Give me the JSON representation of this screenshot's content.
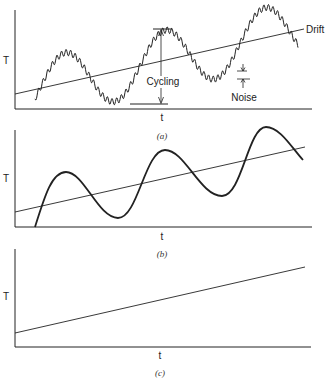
{
  "figure": {
    "panels": [
      {
        "id": "a",
        "caption": "(a)",
        "y_label": "T",
        "x_label": "t",
        "annotations": {
          "drift": "Drift",
          "cycling": "Cycling",
          "noise": "Noise"
        }
      },
      {
        "id": "b",
        "caption": "(b)",
        "y_label": "T",
        "x_label": "t"
      },
      {
        "id": "c",
        "caption": "(c)",
        "y_label": "T",
        "x_label": "t"
      }
    ]
  },
  "colors": {
    "line": "#1a1a1a",
    "background": "#ffffff"
  }
}
